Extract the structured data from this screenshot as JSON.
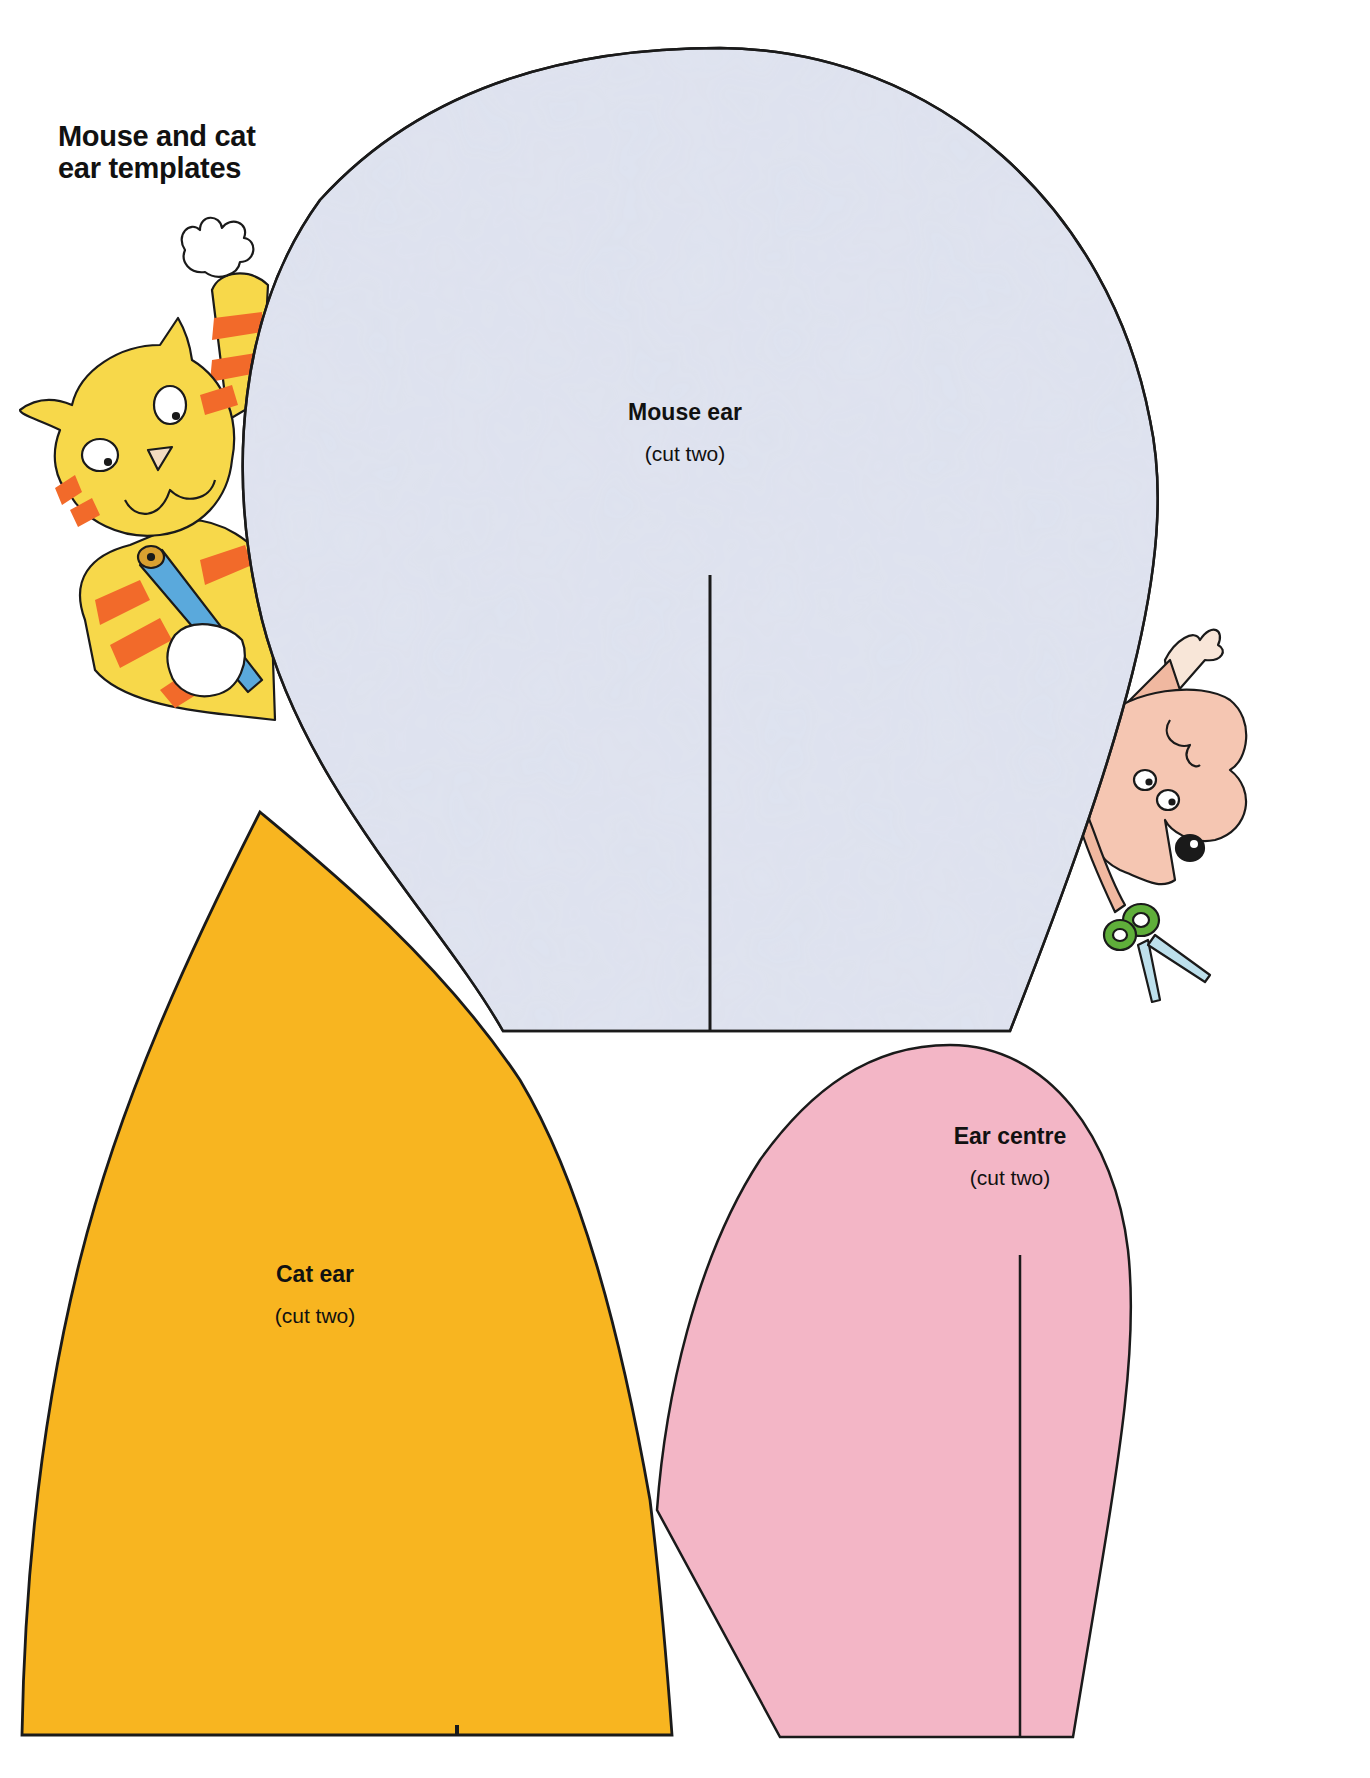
{
  "page": {
    "title_lines": [
      "Mouse and cat",
      "ear templates"
    ]
  },
  "templates": [
    {
      "id": "mouse-ear",
      "name": "Mouse ear",
      "note": "(cut two)",
      "fill": "#dfe3ef"
    },
    {
      "id": "cat-ear",
      "name": "Cat ear",
      "note": "(cut two)",
      "fill": "#f8b520"
    },
    {
      "id": "ear-centre",
      "name": "Ear centre",
      "note": "(cut two)",
      "fill": "#f3b6c6"
    }
  ],
  "illustrations": [
    {
      "id": "cat",
      "description": "striped cat holding a blue pencil, peeking from behind mouse ear"
    },
    {
      "id": "mouse",
      "description": "pink mouse holding green-handled scissors, peeking from behind mouse ear"
    }
  ],
  "colors": {
    "outline": "#1a1a1a",
    "cat_yellow": "#f7d84a",
    "cat_stripe": "#f26a2a",
    "pencil_blue": "#5aa9dc",
    "mouse_pink": "#f5c6b2",
    "scissors_green": "#5fae3a"
  }
}
